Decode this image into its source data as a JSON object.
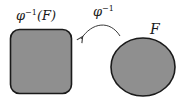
{
  "diagram": {
    "preimage_set": {
      "label_base": "φ",
      "label_exp": "−1",
      "label_arg": "(F)",
      "shape": "rounded-square",
      "fill": "#8f8f8f",
      "stroke": "#1a1a1a"
    },
    "mapping": {
      "label_base": "φ",
      "label_exp": "−1",
      "direction": "from F to φ⁻¹(F)",
      "stroke": "#3a3a3a"
    },
    "image_set": {
      "label": "F",
      "shape": "ellipse",
      "fill": "#8f8f8f",
      "stroke": "#1a1a1a"
    }
  }
}
